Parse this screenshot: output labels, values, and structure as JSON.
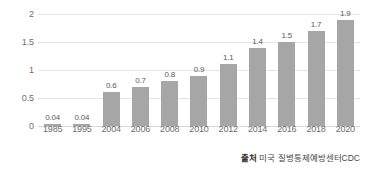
{
  "chart_data": {
    "type": "bar",
    "title": "",
    "subtitle": "",
    "xlabel": "",
    "ylabel": "",
    "categories": [
      "1985",
      "1995",
      "2004",
      "2006",
      "2008",
      "2010",
      "2012",
      "2014",
      "2016",
      "2018",
      "2020"
    ],
    "values": [
      0.04,
      0.04,
      0.6,
      0.7,
      0.8,
      0.9,
      1.1,
      1.4,
      1.5,
      1.7,
      1.9
    ],
    "value_labels": [
      "0.04",
      "0.04",
      "0.6",
      "0.7",
      "0.8",
      "0.9",
      "1.1",
      "1.4",
      "1.5",
      "1.7",
      "1.9"
    ],
    "ylim": [
      0,
      2
    ],
    "yticks": [
      0,
      0.5,
      1,
      1.5,
      2
    ],
    "ytick_labels": [
      "0",
      "0.5",
      "1",
      "1.5",
      "2"
    ],
    "grid": true,
    "legend": false,
    "legend_position": "none",
    "bar_color": "#a6a6a6",
    "gridline_color": "#e4e4e4",
    "background_color": "#ffffff"
  },
  "source": {
    "prefix": "출처",
    "body": " 미국 질병통제예방센터CDC"
  }
}
